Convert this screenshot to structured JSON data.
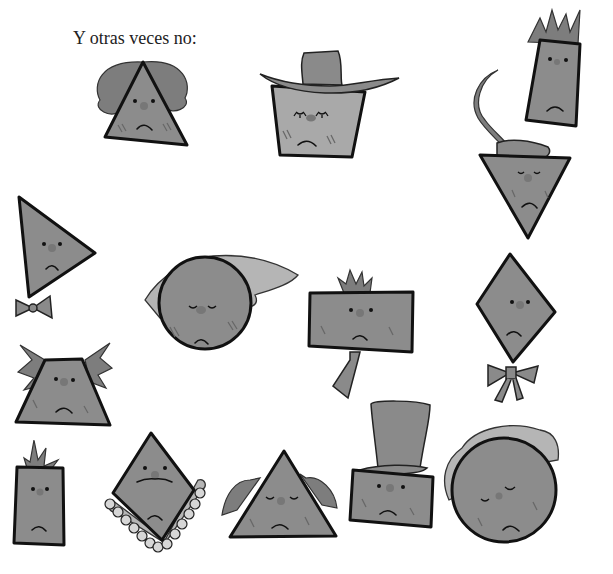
{
  "page": {
    "caption": "Y otras veces no:",
    "background_color": "#ffffff",
    "fill_color": "#8c8c8c",
    "outline_color": "#111111"
  },
  "characters": [
    {
      "shape": "triangle",
      "accessory": "wavy-hair",
      "expression": "sad"
    },
    {
      "shape": "inverted-trapezoid",
      "accessory": "cowboy-hat",
      "expression": "sad-sleepy"
    },
    {
      "shape": "tall-rectangle",
      "accessory": "spiky-hair",
      "expression": "sad"
    },
    {
      "shape": "inverted-triangle",
      "accessory": "feather-hat",
      "expression": "sad-sleepy"
    },
    {
      "shape": "tilted-triangle",
      "accessory": "bow-tie",
      "expression": "sad"
    },
    {
      "shape": "circle",
      "accessory": "headscarf",
      "expression": "sad-sleepy"
    },
    {
      "shape": "wide-rectangle",
      "accessory": "necktie",
      "expression": "sad"
    },
    {
      "shape": "diamond",
      "accessory": "bow",
      "expression": "sad"
    },
    {
      "shape": "trapezoid",
      "accessory": "wild-hair",
      "expression": "sad"
    },
    {
      "shape": "small-rectangle",
      "accessory": "grass-hair",
      "expression": "sad"
    },
    {
      "shape": "diamond",
      "accessory": "lace-collar-mustache",
      "expression": "sad"
    },
    {
      "shape": "triangle",
      "accessory": "dreadlock-hair",
      "expression": "sad-sleepy"
    },
    {
      "shape": "rectangle",
      "accessory": "top-hat",
      "expression": "sad"
    },
    {
      "shape": "circle",
      "accessory": "curly-hair",
      "expression": "sad-winking"
    }
  ]
}
